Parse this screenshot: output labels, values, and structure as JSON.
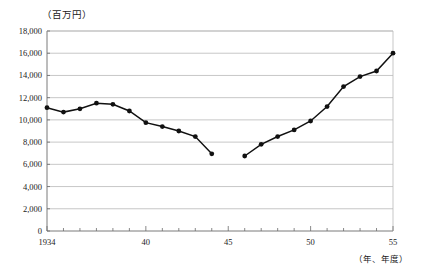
{
  "chart_data": {
    "type": "line",
    "title": "",
    "subtitle": "",
    "ylabel": "（百万円）",
    "xlabel": "（年、年度）",
    "xtick_labels": [
      "1934",
      "40",
      "45",
      "50",
      "55"
    ],
    "xtick_values": [
      1934,
      1940,
      1945,
      1950,
      1955
    ],
    "ytick_labels": [
      "0",
      "2,000",
      "4,000",
      "6,000",
      "8,000",
      "10,000",
      "12,000",
      "14,000",
      "16,000",
      "18,000"
    ],
    "ytick_values": [
      0,
      2000,
      4000,
      6000,
      8000,
      10000,
      12000,
      14000,
      16000,
      18000
    ],
    "xlim": [
      1934,
      1955
    ],
    "ylim": [
      0,
      18000
    ],
    "grid": "horizontal",
    "legend": "none",
    "marker": "filled-circle",
    "series": [
      {
        "name": "segment-prewar",
        "x": [
          1934,
          1935,
          1936,
          1937,
          1938,
          1939,
          1940,
          1941,
          1942,
          1943,
          1944
        ],
        "values": [
          11100,
          10700,
          11000,
          11500,
          11400,
          10800,
          9750,
          9400,
          9000,
          8500,
          6950
        ]
      },
      {
        "name": "segment-postwar",
        "x": [
          1946,
          1947,
          1948,
          1949,
          1950,
          1951,
          1952,
          1953,
          1954,
          1955
        ],
        "values": [
          6750,
          7800,
          8500,
          9100,
          9900,
          11200,
          13000,
          13900,
          14400,
          16000
        ]
      }
    ],
    "colors": {
      "line": "#111111",
      "marker": "#111111",
      "grid": "#b9b9b9",
      "axis": "#6b6b6b",
      "background": "#ffffff"
    }
  }
}
